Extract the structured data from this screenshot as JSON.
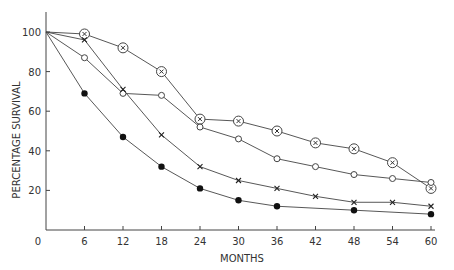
{
  "chart_data": {
    "type": "line",
    "title": "",
    "xlabel": "MONTHS",
    "ylabel": "PERCENTAGE SURVIVAL",
    "xlim": [
      0,
      60
    ],
    "ylim": [
      0,
      100
    ],
    "x_ticks": [
      0,
      6,
      12,
      18,
      24,
      30,
      36,
      42,
      48,
      54,
      60
    ],
    "y_ticks": [
      20,
      40,
      60,
      80,
      100
    ],
    "grid": false,
    "legend": "none",
    "series": [
      {
        "name": "circled-cross",
        "marker": "circled-x",
        "x": [
          0,
          6,
          12,
          18,
          24,
          30,
          36,
          42,
          48,
          54,
          60
        ],
        "values": [
          100,
          99,
          92,
          80,
          56,
          55,
          50,
          44,
          41,
          34,
          21
        ]
      },
      {
        "name": "open-circle",
        "marker": "open-circle",
        "x": [
          0,
          6,
          12,
          18,
          24,
          30,
          36,
          42,
          48,
          54,
          60
        ],
        "values": [
          100,
          87,
          69,
          68,
          52,
          46,
          36,
          32,
          28,
          26,
          24
        ]
      },
      {
        "name": "cross",
        "marker": "x",
        "x": [
          0,
          6,
          12,
          18,
          24,
          30,
          36,
          42,
          48,
          54,
          60
        ],
        "values": [
          100,
          96,
          71,
          48,
          32,
          25,
          21,
          17,
          14,
          14,
          12
        ]
      },
      {
        "name": "filled-circle",
        "marker": "filled-circle",
        "x": [
          0,
          6,
          12,
          18,
          24,
          30,
          36,
          48,
          60
        ],
        "values": [
          100,
          69,
          47,
          32,
          21,
          15,
          12,
          10,
          8
        ]
      }
    ]
  }
}
